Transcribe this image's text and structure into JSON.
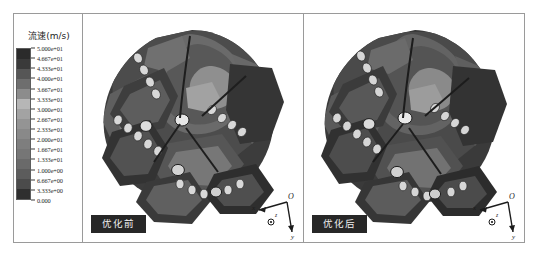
{
  "figure": {
    "background_color": "#ffffff",
    "frame_color": "#9a9a9a"
  },
  "legend": {
    "title": "流速(m/s)",
    "band_colors": [
      "#2b2b2b",
      "#3a3a3a",
      "#565656",
      "#6e6e6e",
      "#8c8c8c",
      "#b6b6b6",
      "#a3a3a3",
      "#949494",
      "#898989",
      "#7e7e7e",
      "#767676",
      "#6a6a6a",
      "#5c5c5c",
      "#4b4b4b",
      "#2f2f2f"
    ],
    "ticks": [
      "5.000e+01",
      "4.667e+01",
      "4.333e+01",
      "4.000e+01",
      "3.667e+01",
      "3.333e+01",
      "3.000e+01",
      "2.667e+01",
      "2.333e+01",
      "2.000e+01",
      "1.667e+01",
      "1.333e+01",
      "1.000e+00",
      "6.667e+00",
      "3.333e+00",
      "0.000"
    ]
  },
  "panels": [
    {
      "id": "before",
      "label": "优化前",
      "axes": {
        "origin": "O",
        "x": "x",
        "y": "y",
        "z": "z"
      }
    },
    {
      "id": "after",
      "label": "优化后",
      "axes": {
        "origin": "O",
        "x": "x",
        "y": "y",
        "z": "z"
      }
    }
  ],
  "chart_data": {
    "type": "heatmap",
    "title": "流速(m/s)",
    "subtitle": "",
    "xlabel": "",
    "ylabel": "",
    "colorbar_label": "流速(m/s)",
    "colorbar_min": 0.0,
    "colorbar_max": 50.0,
    "colorbar_levels": 16,
    "colorbar_tick_values": [
      50.0,
      46.67,
      43.33,
      40.0,
      36.67,
      33.33,
      30.0,
      26.67,
      23.33,
      20.0,
      16.67,
      13.33,
      10.0,
      6.667,
      3.333,
      0.0
    ],
    "colorbar_tick_labels": [
      "5.000e+01",
      "4.667e+01",
      "4.333e+01",
      "4.000e+01",
      "3.667e+01",
      "3.333e+01",
      "3.000e+01",
      "2.667e+01",
      "2.333e+01",
      "2.000e+01",
      "1.667e+01",
      "1.333e+01",
      "1.000e+00",
      "6.667e+00",
      "3.333e+00",
      "0.000"
    ],
    "colormap": "grayscale",
    "grid": false,
    "legend_position": "left",
    "panels": [
      {
        "name": "优化前",
        "description": "PDC drill bit surface flow velocity contour before optimization"
      },
      {
        "name": "优化后",
        "description": "PDC drill bit surface flow velocity contour after optimization"
      }
    ]
  }
}
